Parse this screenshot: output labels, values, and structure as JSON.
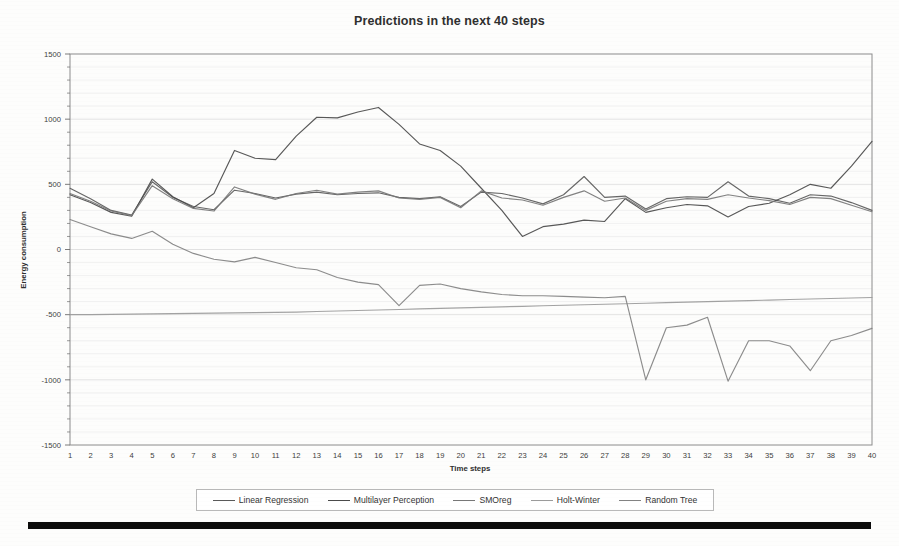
{
  "chart_data": {
    "type": "line",
    "title": "Predictions in the next 40 steps",
    "xlabel": "Time steps",
    "ylabel": "Energy consumption",
    "ylim": [
      -1500,
      1500
    ],
    "xlim": [
      1,
      40
    ],
    "y_ticks": [
      1500,
      1000,
      500,
      0,
      -500,
      -1000,
      -1500
    ],
    "y_minor_step": 100,
    "grid": "horizontal-minor",
    "legend_position": "bottom",
    "categories": [
      1,
      2,
      3,
      4,
      5,
      6,
      7,
      8,
      9,
      10,
      11,
      12,
      13,
      14,
      15,
      16,
      17,
      18,
      19,
      20,
      21,
      22,
      23,
      24,
      25,
      26,
      27,
      28,
      29,
      30,
      31,
      32,
      33,
      34,
      35,
      36,
      37,
      38,
      39,
      40
    ],
    "series": [
      {
        "name": "Linear Regression",
        "color": "#5a5a5a",
        "values": [
          470,
          390,
          300,
          265,
          520,
          400,
          330,
          305,
          455,
          430,
          395,
          425,
          440,
          420,
          430,
          435,
          400,
          390,
          405,
          330,
          440,
          430,
          395,
          350,
          420,
          560,
          400,
          410,
          310,
          390,
          405,
          400,
          520,
          410,
          390,
          355,
          420,
          410,
          360,
          300
        ]
      },
      {
        "name": "Multilayer Perception",
        "color": "#4a4a4a",
        "values": [
          420,
          360,
          285,
          255,
          540,
          405,
          320,
          430,
          760,
          700,
          690,
          870,
          1015,
          1010,
          1055,
          1090,
          960,
          810,
          760,
          640,
          470,
          300,
          100,
          175,
          195,
          225,
          215,
          390,
          285,
          320,
          345,
          335,
          250,
          330,
          355,
          420,
          500,
          470,
          640,
          830
        ]
      },
      {
        "name": "SMOreg",
        "color": "#777777",
        "values": [
          430,
          370,
          295,
          260,
          490,
          390,
          315,
          295,
          480,
          425,
          385,
          430,
          455,
          425,
          440,
          450,
          395,
          385,
          400,
          320,
          450,
          395,
          380,
          340,
          400,
          450,
          370,
          395,
          300,
          370,
          390,
          385,
          420,
          395,
          375,
          345,
          400,
          390,
          340,
          290
        ]
      },
      {
        "name": "Holt-Winter",
        "color": "#9b9b9b",
        "values": [
          -500,
          -500,
          -498,
          -496,
          -494,
          -492,
          -490,
          -488,
          -486,
          -484,
          -482,
          -480,
          -476,
          -472,
          -468,
          -464,
          -460,
          -456,
          -452,
          -448,
          -444,
          -440,
          -436,
          -432,
          -428,
          -424,
          -420,
          -416,
          -412,
          -408,
          -404,
          -400,
          -396,
          -392,
          -388,
          -384,
          -380,
          -376,
          -372,
          -368
        ]
      },
      {
        "name": "Random Tree",
        "color": "#828282",
        "values": [
          230,
          175,
          120,
          85,
          140,
          40,
          -30,
          -75,
          -95,
          -60,
          -100,
          -140,
          -155,
          -215,
          -250,
          -270,
          -430,
          -275,
          -265,
          -300,
          -325,
          -345,
          -355,
          -355,
          -360,
          -365,
          -370,
          -360,
          -1000,
          -600,
          -580,
          -520,
          -1010,
          -700,
          -700,
          -740,
          -930,
          -700,
          -660,
          -605
        ]
      }
    ]
  },
  "legend": {
    "items": [
      {
        "label": "Linear Regression"
      },
      {
        "label": "Multilayer Perception"
      },
      {
        "label": "SMOreg"
      },
      {
        "label": "Holt-Winter"
      },
      {
        "label": "Random Tree"
      }
    ]
  }
}
